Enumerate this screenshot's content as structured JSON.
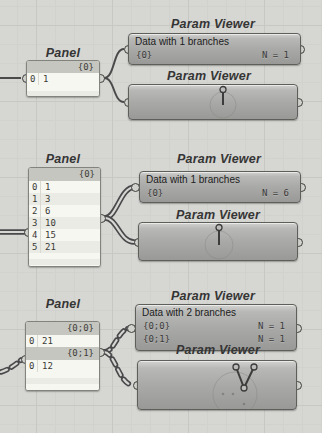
{
  "colors": {
    "canvas_bg": "#d6d6d3",
    "wire": "#4a4a4a",
    "panel_body": "#f5f5f0",
    "panel_header_strip": "#c6c6c0",
    "viewer_gradient_top": "#d2d2d0",
    "viewer_gradient_bottom": "#999997",
    "component_border": "#5e5e5b"
  },
  "groups": {
    "g1": {
      "panel": {
        "title": "Panel",
        "sections": [
          {
            "header": "{0}",
            "rows": [
              {
                "i": "0",
                "v": "1"
              }
            ]
          }
        ]
      },
      "viewer_text": {
        "title": "Param Viewer",
        "summary": "Data with 1 branches",
        "entries": [
          {
            "path": "{0}",
            "count": "N = 1"
          }
        ]
      },
      "viewer_draw": {
        "title": "Param Viewer"
      }
    },
    "g2": {
      "panel": {
        "title": "Panel",
        "sections": [
          {
            "header": "{0}",
            "rows": [
              {
                "i": "0",
                "v": "1"
              },
              {
                "i": "1",
                "v": "3"
              },
              {
                "i": "2",
                "v": "6"
              },
              {
                "i": "3",
                "v": "10"
              },
              {
                "i": "4",
                "v": "15"
              },
              {
                "i": "5",
                "v": "21"
              }
            ]
          }
        ]
      },
      "viewer_text": {
        "title": "Param Viewer",
        "summary": "Data with 1 branches",
        "entries": [
          {
            "path": "{0}",
            "count": "N = 6"
          }
        ]
      },
      "viewer_draw": {
        "title": "Param Viewer"
      }
    },
    "g3": {
      "panel": {
        "title": "Panel",
        "sections": [
          {
            "header": "{0;0}",
            "rows": [
              {
                "i": "0",
                "v": "21"
              }
            ]
          },
          {
            "header": "{0;1}",
            "rows": [
              {
                "i": "0",
                "v": "12"
              }
            ]
          }
        ]
      },
      "viewer_text": {
        "title": "Param Viewer",
        "summary": "Data with 2 branches",
        "entries": [
          {
            "path": "{0;0}",
            "count": "N = 1"
          },
          {
            "path": "{0;1}",
            "count": "N = 1"
          }
        ]
      },
      "viewer_draw": {
        "title": "Param Viewer"
      }
    }
  }
}
